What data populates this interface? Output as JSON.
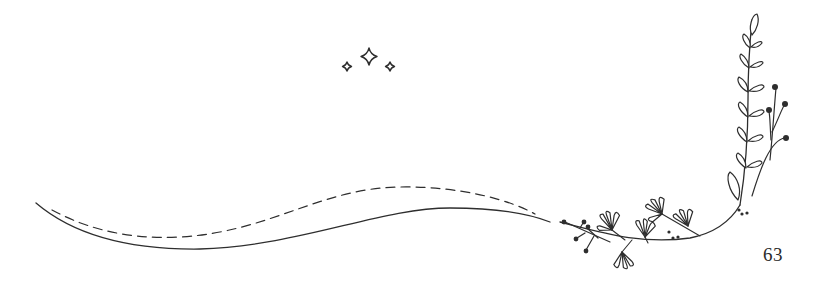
{
  "page": {
    "number": "63"
  },
  "decorations": {
    "sparkles": [
      "small-sparkle",
      "large-sparkle",
      "small-sparkle"
    ],
    "swoosh": [
      "solid-curve",
      "dashed-curve"
    ],
    "floral": [
      "leafy-branch",
      "berry-stems",
      "blossom-sprigs",
      "dots"
    ]
  },
  "colors": {
    "ink": "#2e2e2e",
    "background": "#ffffff"
  }
}
